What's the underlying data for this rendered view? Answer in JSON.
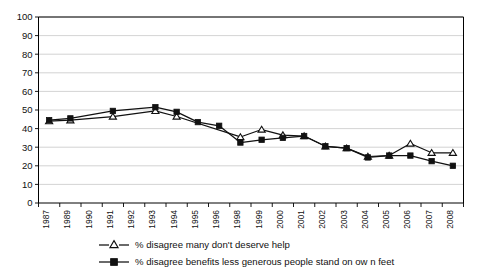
{
  "chart_data": {
    "type": "line",
    "title": "",
    "subtitle": "",
    "xlabel": "",
    "ylabel": "",
    "ylim": [
      0,
      100
    ],
    "ytick_step": 10,
    "grid": true,
    "legend_position": "bottom",
    "categories": [
      "1987",
      "1989",
      "1990",
      "1991",
      "1992",
      "1993",
      "1994",
      "1995",
      "1996",
      "1998",
      "1999",
      "2000",
      "2001",
      "2002",
      "2003",
      "2004",
      "2005",
      "2006",
      "2007",
      "2008"
    ],
    "ytick_labels": [
      "100",
      "90",
      "80",
      "70",
      "60",
      "50",
      "40",
      "30",
      "20",
      "10",
      "0"
    ],
    "series": [
      {
        "name": "% disagree many don't deserve help",
        "marker": "open-triangle",
        "values": [
          44,
          44.5,
          null,
          46.5,
          null,
          49.5,
          46.5,
          null,
          null,
          35.5,
          39.5,
          36.5,
          36,
          30.5,
          29.5,
          25,
          25.5,
          32,
          27,
          27
        ]
      },
      {
        "name": "% disagree benefits less generous people stand on own feet",
        "marker": "filled-square",
        "values": [
          44.5,
          45.5,
          null,
          49.5,
          null,
          51.5,
          49,
          43.5,
          41.5,
          32.5,
          34,
          35,
          36,
          30.5,
          29.5,
          24.5,
          25.5,
          25.5,
          22.5,
          20
        ]
      }
    ]
  },
  "legend": {
    "items": [
      {
        "label": "% disagree many don't deserve help",
        "marker": "open-triangle"
      },
      {
        "label": "% disagree benefits less generous people stand on ow n feet",
        "marker": "filled-square"
      }
    ]
  },
  "colors": {
    "line": "#111111",
    "grid": "#c8c8c8",
    "axis": "#000000",
    "background": "#ffffff"
  }
}
